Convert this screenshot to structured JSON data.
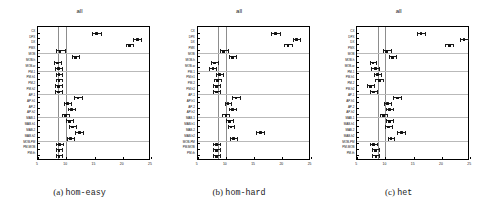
{
  "figure": {
    "panel_count": 3,
    "shared_title": "all",
    "row_labels": [
      "CX",
      "DPX",
      "DX",
      "PMX",
      "MOB",
      "MOB-h",
      "MOB-w",
      "PM-1",
      "PM-h1",
      "PM-2",
      "PM-h2",
      "AP-1",
      "AP-h1",
      "AP-2",
      "AP-h2",
      "MAB-1",
      "MAB-h1",
      "MAB-2",
      "MAB-h2",
      "MOB-PM",
      "PM-MOB",
      "PM-th"
    ],
    "group_separator_after": [
      "PMX",
      "MOB-w",
      "PM-h2",
      "AP-h2",
      "MAB-h2"
    ],
    "reference_lines": [
      8.6,
      10.0
    ]
  },
  "captions": [
    {
      "index": "(a)",
      "name": "hom-easy"
    },
    {
      "index": "(b)",
      "name": "hom-hard"
    },
    {
      "index": "(c)",
      "name": "het"
    }
  ],
  "chart_data": [
    {
      "type": "scatter",
      "title": "all",
      "caption": "(a) hom-easy",
      "xlabel": "",
      "ylabel": "",
      "xlim": [
        5,
        25
      ],
      "xticks": [
        5,
        10,
        15,
        20,
        25
      ],
      "grid": true,
      "legend": null,
      "categories": [
        "CX",
        "DPX",
        "DX",
        "PMX",
        "MOB",
        "MOB-h",
        "MOB-w",
        "PM-1",
        "PM-h1",
        "PM-2",
        "PM-h2",
        "AP-1",
        "AP-h1",
        "AP-2",
        "AP-h2",
        "MAB-1",
        "MAB-h1",
        "MAB-2",
        "MAB-h2",
        "MOB-PM",
        "PM-MOB",
        "PM-th"
      ],
      "values": [
        15.4,
        22.6,
        21.2,
        8.9,
        11.6,
        8.5,
        8.6,
        8.7,
        8.7,
        8.6,
        8.6,
        12.1,
        10.2,
        10.9,
        9.9,
        10.6,
        11.1,
        12.3,
        10.8,
        8.8,
        8.7,
        8.7
      ],
      "ci_low": [
        14.6,
        21.9,
        20.5,
        8.1,
        11.0,
        7.9,
        8.0,
        8.1,
        8.1,
        8.0,
        8.0,
        11.4,
        9.6,
        10.3,
        9.3,
        10.0,
        10.5,
        11.6,
        10.2,
        8.2,
        8.1,
        8.1
      ],
      "ci_high": [
        16.2,
        23.3,
        21.9,
        9.7,
        12.2,
        9.1,
        9.2,
        9.3,
        9.3,
        9.2,
        9.2,
        12.8,
        10.8,
        11.5,
        10.5,
        11.2,
        11.7,
        13.0,
        11.4,
        9.4,
        9.3,
        9.3
      ]
    },
    {
      "type": "scatter",
      "title": "all",
      "caption": "(b) hom-hard",
      "xlabel": "",
      "ylabel": "",
      "xlim": [
        5,
        25
      ],
      "xticks": [
        5,
        10,
        15,
        20,
        25
      ],
      "grid": true,
      "legend": null,
      "categories": [
        "CX",
        "DPX",
        "DX",
        "PMX",
        "MOB",
        "MOB-h",
        "MOB-w",
        "PM-1",
        "PM-h1",
        "PM-2",
        "PM-h2",
        "AP-1",
        "AP-h1",
        "AP-2",
        "AP-h2",
        "MAB-1",
        "MAB-h1",
        "MAB-2",
        "MAB-h2",
        "MOB-PM",
        "PM-MOB",
        "PM-th"
      ],
      "values": [
        18.8,
        22.5,
        21.0,
        9.6,
        11.2,
        8.0,
        7.7,
        8.9,
        8.5,
        8.4,
        8.4,
        11.8,
        10.4,
        11.2,
        10.0,
        10.7,
        10.9,
        16.1,
        11.4,
        8.3,
        8.3,
        8.4
      ],
      "ci_low": [
        18.0,
        21.8,
        20.3,
        8.9,
        10.6,
        7.4,
        7.1,
        8.3,
        7.9,
        7.8,
        7.8,
        11.1,
        9.8,
        10.6,
        9.4,
        10.1,
        10.3,
        15.4,
        10.8,
        7.7,
        7.7,
        7.8
      ],
      "ci_high": [
        19.6,
        23.2,
        21.7,
        10.3,
        11.8,
        8.6,
        8.3,
        9.5,
        9.1,
        9.0,
        9.0,
        12.5,
        11.0,
        11.8,
        10.6,
        11.3,
        11.5,
        16.8,
        12.0,
        8.9,
        8.9,
        9.0
      ]
    },
    {
      "type": "scatter",
      "title": "all",
      "caption": "(c) het",
      "xlabel": "",
      "ylabel": "",
      "xlim": [
        5,
        25
      ],
      "xticks": [
        5,
        10,
        15,
        20,
        25
      ],
      "grid": true,
      "legend": null,
      "categories": [
        "CX",
        "DPX",
        "DX",
        "PMX",
        "MOB",
        "MOB-h",
        "MOB-w",
        "PM-1",
        "PM-h1",
        "PM-2",
        "PM-h2",
        "AP-1",
        "AP-h1",
        "AP-2",
        "AP-h2",
        "MAB-1",
        "MAB-h1",
        "MAB-2",
        "MAB-h2",
        "MOB-PM",
        "PM-MOB",
        "PM-th"
      ],
      "values": [
        16.3,
        23.9,
        21.3,
        10.2,
        11.3,
        7.8,
        8.2,
        8.6,
        8.9,
        7.4,
        7.9,
        12.1,
        10.4,
        10.7,
        9.7,
        10.7,
        10.5,
        12.8,
        11.0,
        7.9,
        8.2,
        8.3
      ],
      "ci_low": [
        15.6,
        23.2,
        20.6,
        9.5,
        10.7,
        7.2,
        7.5,
        8.0,
        8.2,
        6.8,
        7.3,
        11.4,
        9.8,
        10.1,
        9.1,
        10.1,
        9.9,
        12.1,
        10.4,
        7.3,
        7.6,
        7.7
      ],
      "ci_high": [
        17.0,
        24.6,
        22.0,
        10.9,
        11.9,
        8.4,
        8.9,
        9.2,
        9.6,
        8.0,
        8.5,
        12.8,
        11.0,
        11.3,
        10.3,
        11.3,
        11.1,
        13.5,
        11.6,
        8.5,
        8.8,
        8.9
      ]
    }
  ]
}
